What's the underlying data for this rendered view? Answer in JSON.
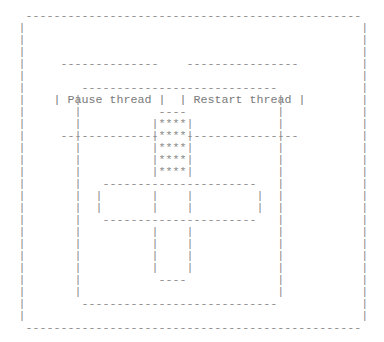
{
  "window": {
    "outer_frame": " ------------------------------------------------\n|                                                |\n|                                                |\n|                                                |\n|                                                |\n|                                                |\n|                                                |\n|                                                |\n|                                                |\n|                                                |\n|                                                |\n|                                                |\n|                                                |\n|                                                |\n|                                                |\n|                                                |\n|                                                |\n|                                                |\n|                                                |\n|                                                |\n|                                                |\n|                                                |\n|                                                |\n|                                                |\n|                                                |\n|                                                |\n ------------------------------------------------"
  },
  "toolbar": {
    "pause_button": {
      "top": " --------------",
      "label_line": "| Pause thread |",
      "label": "Pause thread",
      "bottom": " --------------"
    },
    "restart_button": {
      "top": " ----------------",
      "label_line": "| Restart thread |",
      "label": "Restart thread",
      "bottom": " ----------------"
    }
  },
  "canvas": {
    "panel_frame": " ----------------------------\n|                            |\n|                            |\n|                            |\n|                            |\n|                            |\n|                            |\n|                            |\n|                            |\n|                            |\n|                            |\n|                            |\n|                            |\n|                            |\n|                            |\n|                            |\n|                            |\n|                            |\n ----------------------------",
    "figure": {
      "top_block": " ----\n|****|\n|****|\n|****|\n|****|\n|****|",
      "cross_bar": " ----------------------\n|       |    |         |\n|       |    |         |\n ----------------------",
      "stem": "|    |\n|    |\n|    |\n|    |\n ----"
    }
  }
}
